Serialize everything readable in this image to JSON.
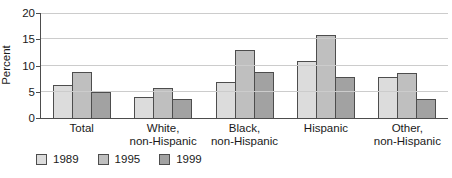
{
  "chart_data": {
    "type": "bar",
    "ylabel": "Percent",
    "ylim": [
      0,
      20
    ],
    "yticks": [
      0,
      5,
      10,
      15,
      20
    ],
    "grid": true,
    "legend_position": "bottom-left",
    "categories": [
      [
        "Total"
      ],
      [
        "White,",
        "non-Hispanic"
      ],
      [
        "Black,",
        "non-Hispanic"
      ],
      [
        "Hispanic"
      ],
      [
        "Other,",
        "non-Hispanic"
      ]
    ],
    "series": [
      {
        "name": "1989",
        "color": "#dcdcdc",
        "values": [
          6.3,
          4.0,
          6.8,
          10.9,
          7.8
        ]
      },
      {
        "name": "1995",
        "color": "#bfbfbf",
        "values": [
          8.7,
          5.7,
          12.9,
          15.8,
          8.6
        ]
      },
      {
        "name": "1999",
        "color": "#a2a2a2",
        "values": [
          5.0,
          3.7,
          8.7,
          7.8,
          3.6
        ]
      }
    ]
  },
  "colors": {
    "axis": "#4d4d4d",
    "gridline": "#cccccc",
    "bar_border": "#4d4d4d",
    "text": "#1a1a1a"
  }
}
